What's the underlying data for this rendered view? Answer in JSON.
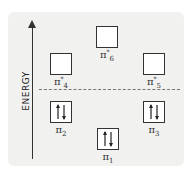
{
  "diagram": {
    "axis_label": "ENERGY",
    "orbitals": [
      {
        "id": "pi6_star",
        "symbol": "π",
        "subscript": "6",
        "superscript": "*",
        "electrons": 0,
        "type": "antibonding"
      },
      {
        "id": "pi4_star",
        "symbol": "π",
        "subscript": "4",
        "superscript": "*",
        "electrons": 0,
        "type": "antibonding"
      },
      {
        "id": "pi5_star",
        "symbol": "π",
        "subscript": "5",
        "superscript": "*",
        "electrons": 0,
        "type": "antibonding"
      },
      {
        "id": "pi2",
        "symbol": "π",
        "subscript": "2",
        "superscript": "",
        "electrons": 2,
        "type": "bonding"
      },
      {
        "id": "pi3",
        "symbol": "π",
        "subscript": "3",
        "superscript": "",
        "electrons": 2,
        "type": "bonding"
      },
      {
        "id": "pi1",
        "symbol": "π",
        "subscript": "1",
        "superscript": "",
        "electrons": 2,
        "type": "bonding"
      }
    ],
    "divider": "HOMO/LUMO gap (dashed line)"
  }
}
